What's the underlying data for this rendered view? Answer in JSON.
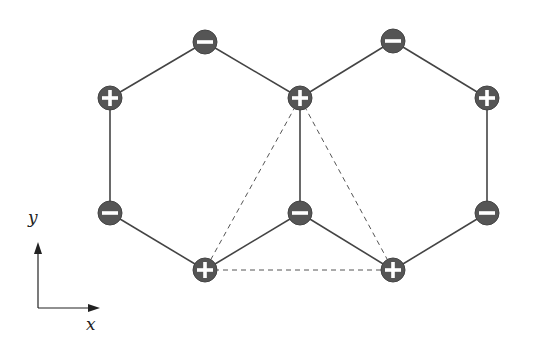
{
  "diagram": {
    "colors": {
      "site_fill": "#555555",
      "site_stroke": "#444444",
      "bond": "#444444",
      "dashed": "#555555",
      "sign": "#ffffff"
    },
    "sites": [
      {
        "id": "s1",
        "x": 205,
        "y": 42,
        "sign": "minus"
      },
      {
        "id": "s2",
        "x": 110,
        "y": 98,
        "sign": "plus"
      },
      {
        "id": "s3",
        "x": 300,
        "y": 98,
        "sign": "plus"
      },
      {
        "id": "s4",
        "x": 393,
        "y": 41,
        "sign": "minus"
      },
      {
        "id": "s5",
        "x": 487,
        "y": 98,
        "sign": "plus"
      },
      {
        "id": "s6",
        "x": 110,
        "y": 213,
        "sign": "minus"
      },
      {
        "id": "s7",
        "x": 300,
        "y": 213,
        "sign": "minus"
      },
      {
        "id": "s8",
        "x": 487,
        "y": 213,
        "sign": "minus"
      },
      {
        "id": "s9",
        "x": 205,
        "y": 270,
        "sign": "plus"
      },
      {
        "id": "s10",
        "x": 393,
        "y": 270,
        "sign": "plus"
      }
    ],
    "bonds": [
      [
        "s1",
        "s2"
      ],
      [
        "s1",
        "s3"
      ],
      [
        "s2",
        "s6"
      ],
      [
        "s6",
        "s9"
      ],
      [
        "s9",
        "s7"
      ],
      [
        "s7",
        "s3"
      ],
      [
        "s3",
        "s4"
      ],
      [
        "s4",
        "s5"
      ],
      [
        "s5",
        "s8"
      ],
      [
        "s8",
        "s10"
      ],
      [
        "s10",
        "s7"
      ]
    ],
    "dashed": [
      [
        "s3",
        "s9"
      ],
      [
        "s3",
        "s10"
      ],
      [
        "s9",
        "s10"
      ]
    ],
    "axes": {
      "origin": {
        "x": 38,
        "y": 308
      },
      "x_tip": {
        "x": 100,
        "y": 308
      },
      "y_tip": {
        "x": 38,
        "y": 242
      },
      "x_label": "x",
      "y_label": "y"
    }
  }
}
